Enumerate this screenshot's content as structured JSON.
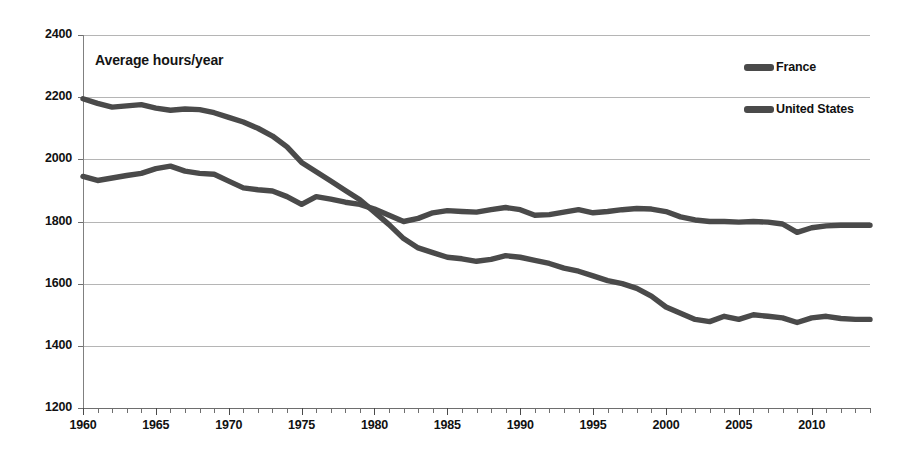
{
  "chart_data": {
    "type": "line",
    "title": "Average hours/year",
    "xlabel": "",
    "ylabel": "Average hours/year",
    "xlim": [
      1960,
      2014
    ],
    "ylim": [
      1200,
      2400
    ],
    "yticks": [
      1200,
      1400,
      1600,
      1800,
      2000,
      2200,
      2400
    ],
    "xticks": [
      1960,
      1965,
      1970,
      1975,
      1980,
      1985,
      1990,
      1995,
      2000,
      2005,
      2010
    ],
    "grid": true,
    "legend_position": "top-right",
    "x": [
      1960,
      1961,
      1962,
      1963,
      1964,
      1965,
      1966,
      1967,
      1968,
      1969,
      1970,
      1971,
      1972,
      1973,
      1974,
      1975,
      1976,
      1977,
      1978,
      1979,
      1980,
      1981,
      1982,
      1983,
      1984,
      1985,
      1986,
      1987,
      1988,
      1989,
      1990,
      1991,
      1992,
      1993,
      1994,
      1995,
      1996,
      1997,
      1998,
      1999,
      2000,
      2001,
      2002,
      2003,
      2004,
      2005,
      2006,
      2007,
      2008,
      2009,
      2010,
      2011,
      2012,
      2013,
      2014
    ],
    "series": [
      {
        "name": "France",
        "color": "#4a4a4a",
        "values": [
          2195,
          2180,
          2168,
          2172,
          2176,
          2165,
          2158,
          2162,
          2160,
          2150,
          2135,
          2120,
          2100,
          2075,
          2040,
          1990,
          1960,
          1930,
          1900,
          1870,
          1830,
          1790,
          1745,
          1715,
          1700,
          1685,
          1680,
          1672,
          1678,
          1690,
          1685,
          1675,
          1665,
          1650,
          1640,
          1625,
          1610,
          1600,
          1585,
          1560,
          1525,
          1505,
          1485,
          1478,
          1495,
          1485,
          1500,
          1495,
          1490,
          1475,
          1490,
          1495,
          1488,
          1485,
          1485
        ]
      },
      {
        "name": "United States",
        "color": "#4a4a4a",
        "values": [
          1945,
          1932,
          1940,
          1948,
          1955,
          1970,
          1978,
          1962,
          1955,
          1952,
          1930,
          1908,
          1902,
          1898,
          1880,
          1855,
          1880,
          1872,
          1862,
          1855,
          1840,
          1820,
          1800,
          1810,
          1828,
          1835,
          1832,
          1830,
          1838,
          1845,
          1838,
          1820,
          1822,
          1830,
          1838,
          1828,
          1832,
          1838,
          1842,
          1840,
          1832,
          1815,
          1805,
          1800,
          1800,
          1798,
          1800,
          1798,
          1792,
          1765,
          1780,
          1786,
          1788,
          1788,
          1788
        ]
      }
    ]
  },
  "legend": {
    "entries": [
      {
        "label": "France"
      },
      {
        "label": "United States"
      }
    ]
  },
  "axis": {
    "y_labels": [
      "2400",
      "2200",
      "2000",
      "1800",
      "1600",
      "1400",
      "1200"
    ],
    "x_labels": [
      "1960",
      "1965",
      "1970",
      "1975",
      "1980",
      "1985",
      "1990",
      "1995",
      "2000",
      "2005",
      "2010"
    ]
  },
  "colors": {
    "series": "#4a4a4a",
    "gridline": "#b5b5b5",
    "axis": "#6e6e6e",
    "background": "#ffffff",
    "text": "#111111"
  }
}
